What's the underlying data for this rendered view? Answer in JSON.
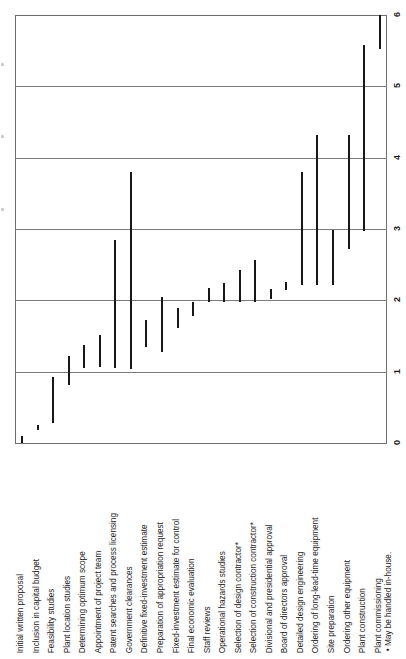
{
  "chart_data": {
    "type": "bar",
    "orientation": "vertical-ranges",
    "title": "",
    "subtitle": "",
    "xlabel": "",
    "ylabel": "",
    "ylim": [
      0,
      6
    ],
    "yticks": [
      0,
      1,
      2,
      3,
      4,
      5,
      6
    ],
    "ytick_labels": [
      "0",
      "1",
      "2",
      "3",
      "4",
      "5",
      "6"
    ],
    "grid": true,
    "grid_axis": "y",
    "legend": "none",
    "units": "years",
    "bar_color": "#171717",
    "grid_color": "#7b7b7b",
    "categories": [
      "Initial written proposal",
      "Inclusion in capital budget",
      "Feasibility studies",
      "Plant location studies",
      "Determining optimum scope",
      "Appointment of project team",
      "Patent searches and process licensing",
      "Government clearances",
      "Definitive fixed-investment estimate",
      "Preparation of appropriation request",
      "Fixed-investment estimate for control",
      "Final economic evaluation",
      "Staff reviews",
      "Operational hazards studies",
      "Selection of design contractor*",
      "Selection of construction contractor*",
      "Divisional and presidential approval",
      "Board of directors approval",
      "Detailed design engineering",
      "Ordering of long-lead-time equipment",
      "Site preparation",
      "Ordering other equipment",
      "Plant construction",
      "Plant commissioning"
    ],
    "bars": [
      {
        "label": "Initial written proposal",
        "start": 0.0,
        "end": 0.1
      },
      {
        "label": "Inclusion in capital budget",
        "start": 0.18,
        "end": 0.26
      },
      {
        "label": "Feasibility studies",
        "start": 0.28,
        "end": 0.92
      },
      {
        "label": "Plant location studies",
        "start": 0.82,
        "end": 1.22
      },
      {
        "label": "Determining optimum scope",
        "start": 1.05,
        "end": 1.38
      },
      {
        "label": "Appointment of project team",
        "start": 1.06,
        "end": 1.52
      },
      {
        "label": "Patent searches and process licensing",
        "start": 1.05,
        "end": 2.84
      },
      {
        "label": "Government clearances",
        "start": 1.04,
        "end": 3.8
      },
      {
        "label": "Definitive fixed-investment estimate",
        "start": 1.35,
        "end": 1.72
      },
      {
        "label": "Preparation of appropriation request",
        "start": 1.28,
        "end": 2.05
      },
      {
        "label": "Fixed-investment estimate for control",
        "start": 1.62,
        "end": 1.9
      },
      {
        "label": "Final economic evaluation",
        "start": 1.78,
        "end": 1.98
      },
      {
        "label": "Staff reviews",
        "start": 1.98,
        "end": 2.18
      },
      {
        "label": "Operational hazards studies",
        "start": 1.98,
        "end": 2.24
      },
      {
        "label": "Selection of design contractor*",
        "start": 1.98,
        "end": 2.42
      },
      {
        "label": "Selection of construction contractor*",
        "start": 1.98,
        "end": 2.56
      },
      {
        "label": "Divisional and presidential approval",
        "start": 2.02,
        "end": 2.16
      },
      {
        "label": "Board of directors approval",
        "start": 2.14,
        "end": 2.26
      },
      {
        "label": "Detailed design engineering",
        "start": 2.22,
        "end": 3.8
      },
      {
        "label": "Ordering of long-lead-time equipment",
        "start": 2.22,
        "end": 4.32
      },
      {
        "label": "Site preparation",
        "start": 2.22,
        "end": 2.98
      },
      {
        "label": "Ordering other equipment",
        "start": 2.72,
        "end": 4.32
      },
      {
        "label": "Plant construction",
        "start": 2.98,
        "end": 5.58
      },
      {
        "label": "Plant commissioning",
        "start": 5.52,
        "end": 6.0
      }
    ]
  },
  "axis": {
    "tick_labels": [
      "6",
      "5",
      "4",
      "3",
      "2",
      "1",
      "0"
    ]
  },
  "footnote": {
    "text": "• May be handled in-house."
  }
}
